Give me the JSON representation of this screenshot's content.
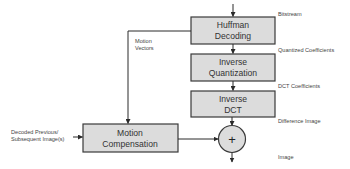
{
  "diagram": {
    "blocks": {
      "huffman": {
        "line1": "Huffman",
        "line2": "Decoding"
      },
      "inverse_quantization": {
        "line1": "Inverse",
        "line2": "Quantization"
      },
      "inverse_dct": {
        "line1": "Inverse",
        "line2": "DCT"
      },
      "motion_compensation": {
        "line1": "Motion",
        "line2": "Compensation"
      },
      "adder": {
        "symbol": "+"
      }
    },
    "labels": {
      "bitstream": "Bitstream",
      "quantized_coefficients": "Quantized Coefficients",
      "dct_coefficients": "DCT Coefficients",
      "difference_image": "Difference Image",
      "image": "Image",
      "motion_vectors_line1": "Motion",
      "motion_vectors_line2": "Vectors",
      "decoded_previous_line1": "Decoded Previous/",
      "decoded_previous_line2": "Subsequent Image(s)"
    },
    "colors": {
      "block_fill": "#dcdcdc",
      "block_stroke": "#3a3a3a",
      "line": "#2a2a2a",
      "text": "#333333"
    }
  }
}
